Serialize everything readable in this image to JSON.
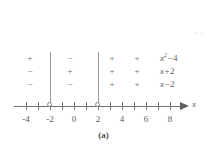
{
  "figure": {
    "caption": "(a)",
    "axis_variable": "x",
    "artifact_mark": "x+y"
  },
  "chart_data": {
    "type": "table",
    "xlabel": "x",
    "ylabel": "",
    "axis": {
      "min": -5,
      "max": 9,
      "tick_step": 1,
      "labeled_ticks": [
        -4,
        -2,
        0,
        2,
        4,
        6,
        8
      ],
      "tick_labels": [
        "-4",
        "-2",
        "0",
        "2",
        "4",
        "6",
        "8"
      ],
      "open_points": [
        -2,
        2
      ],
      "arrow_end": "right"
    },
    "intervals": [
      {
        "label": "(-inf, -2)",
        "center": -3.5
      },
      {
        "label": "(-2, 2)",
        "center": 0
      },
      {
        "label": "(2, 5)",
        "center": 3.5
      },
      {
        "label": "(5, inf)",
        "center": 6
      }
    ],
    "dividers": [
      -2,
      2
    ],
    "rows": [
      {
        "expression": "x^2-4",
        "expr_base": "x",
        "expr_exp": "2",
        "expr_op": "−",
        "expr_num": "4",
        "signs": [
          "+",
          "−",
          "+",
          "+"
        ]
      },
      {
        "expression": "x+2",
        "expr_base": "x",
        "expr_exp": "",
        "expr_op": "+",
        "expr_num": "2",
        "signs": [
          "−",
          "+",
          "+",
          "+"
        ]
      },
      {
        "expression": "x-2",
        "expr_base": "x",
        "expr_exp": "",
        "expr_op": "−",
        "expr_num": "2",
        "signs": [
          "−",
          "−",
          "+",
          "+"
        ]
      }
    ]
  }
}
